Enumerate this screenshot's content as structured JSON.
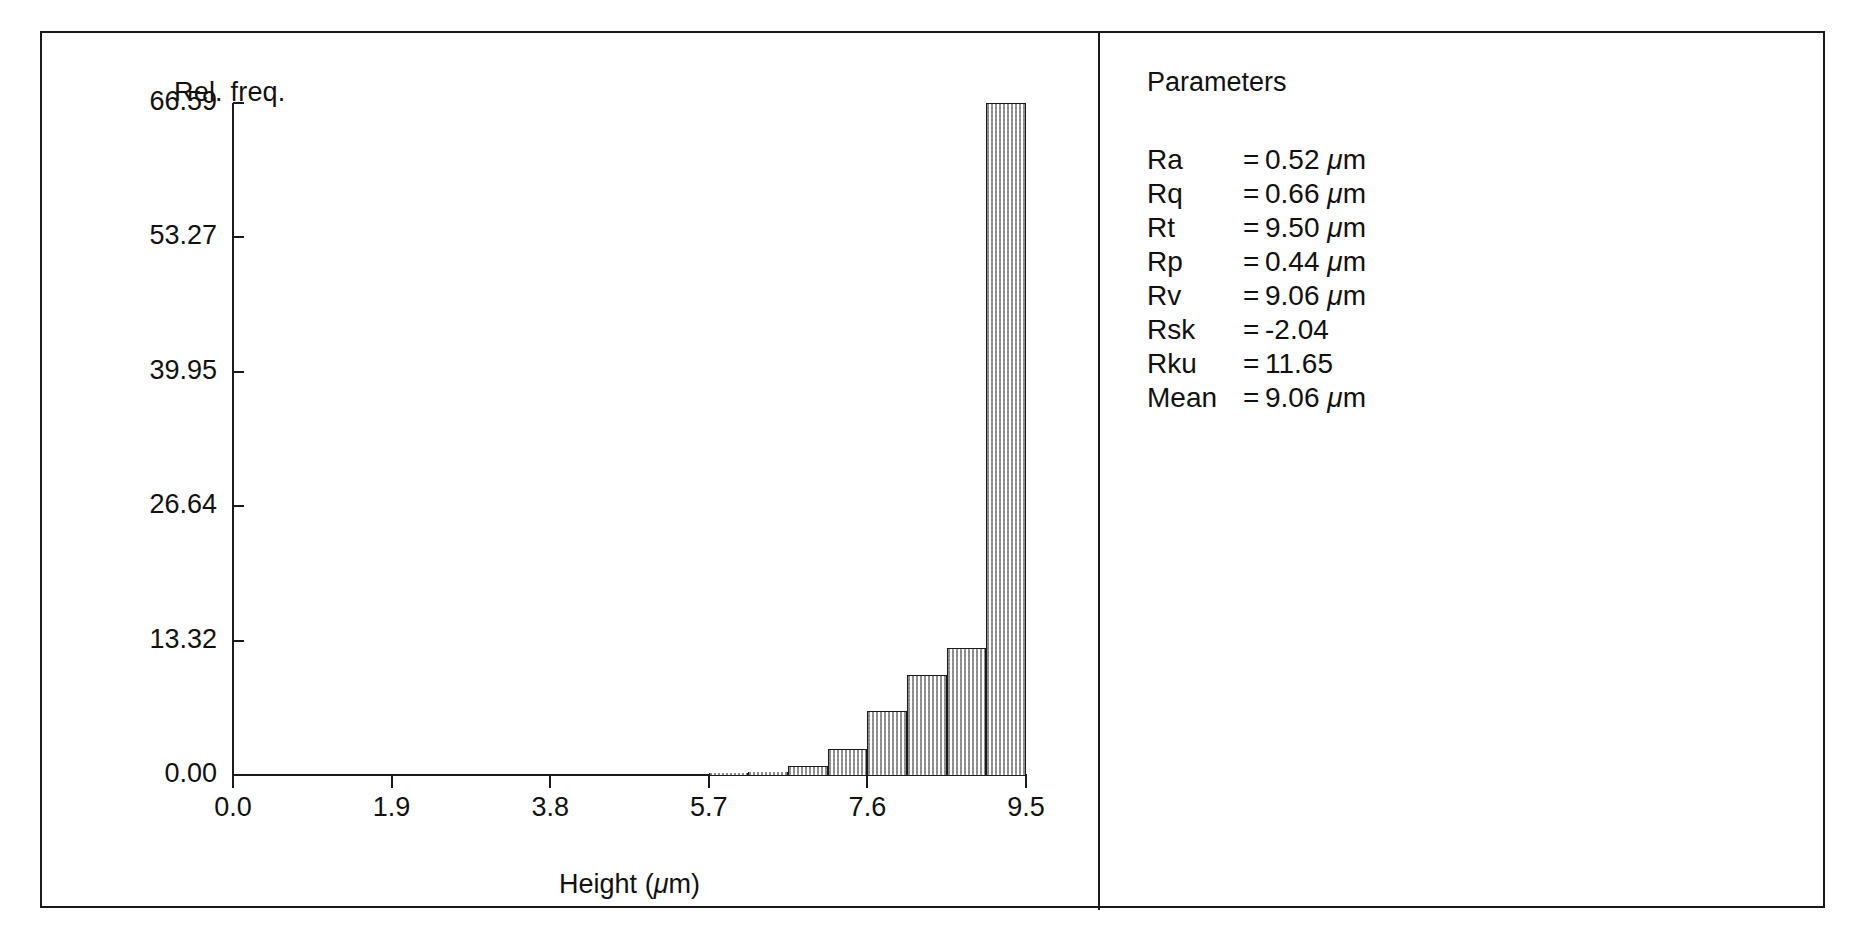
{
  "figure": {
    "panels": [
      "histogram",
      "parameters"
    ]
  },
  "chart_data": {
    "type": "bar",
    "title": "",
    "ylabel": "Rel. freq.",
    "xlabel": "Height (µm)",
    "xlabel_text": "Height (",
    "xlabel_unit": "m)",
    "ylim": [
      0.0,
      66.59
    ],
    "xlim": [
      0.0,
      9.5
    ],
    "grid": false,
    "legend": null,
    "y_ticks": [
      "0.00",
      "13.32",
      "26.64",
      "39.95",
      "53.27",
      "66.59"
    ],
    "y_tick_values": [
      0.0,
      13.32,
      26.64,
      39.95,
      53.27,
      66.59
    ],
    "x_ticks": [
      "0.0",
      "1.9",
      "3.8",
      "5.7",
      "7.6",
      "9.5"
    ],
    "x_tick_values": [
      0.0,
      1.9,
      3.8,
      5.7,
      7.6,
      9.5
    ],
    "bin_width": 0.475,
    "bin_left_edges": [
      0.0,
      0.475,
      0.95,
      1.425,
      1.9,
      2.375,
      2.85,
      3.325,
      3.8,
      4.275,
      4.75,
      5.225,
      5.7,
      6.175,
      6.65,
      7.125,
      7.6,
      8.075,
      8.55,
      9.025
    ],
    "categories": [
      "0.00",
      "0.48",
      "0.95",
      "1.43",
      "1.90",
      "2.38",
      "2.85",
      "3.33",
      "3.80",
      "4.28",
      "4.75",
      "5.23",
      "5.70",
      "6.18",
      "6.65",
      "7.13",
      "7.60",
      "8.08",
      "8.55",
      "9.03"
    ],
    "values": [
      0.0,
      0.0,
      0.0,
      0.0,
      0.0,
      0.0,
      0.0,
      0.0,
      0.0,
      0.0,
      0.0,
      0.0,
      0.1,
      0.25,
      0.85,
      2.6,
      6.3,
      9.9,
      12.6,
      66.59
    ]
  },
  "parameters": {
    "title": "Parameters",
    "rows": [
      {
        "name": "Ra",
        "eq": "=",
        "value": "0.52",
        "unit": "m"
      },
      {
        "name": "Rq",
        "eq": "=",
        "value": "0.66",
        "unit": "m"
      },
      {
        "name": "Rt",
        "eq": "=",
        "value": "9.50",
        "unit": "m"
      },
      {
        "name": "Rp",
        "eq": "=",
        "value": "0.44",
        "unit": "m"
      },
      {
        "name": "Rv",
        "eq": "=",
        "value": "9.06",
        "unit": "m"
      },
      {
        "name": "Rsk",
        "eq": "=",
        "value": "-2.04",
        "unit": ""
      },
      {
        "name": "Rku",
        "eq": "=",
        "value": "11.65",
        "unit": ""
      },
      {
        "name": "Mean",
        "eq": "=",
        "value": "9.06",
        "unit": "m"
      }
    ]
  },
  "colors": {
    "ink": "#1a1a1a",
    "background": "#ffffff",
    "bar_fill": "#7a7a7a"
  }
}
